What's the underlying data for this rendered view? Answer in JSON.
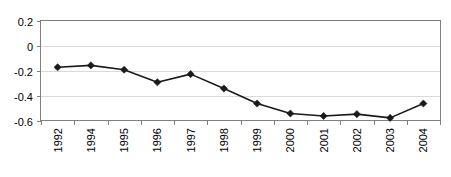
{
  "chart_data": {
    "type": "line",
    "title": "",
    "xlabel": "",
    "ylabel": "",
    "categories": [
      "1992",
      "1994",
      "1995",
      "1996",
      "1997",
      "1998",
      "1999",
      "2000",
      "2001",
      "2002",
      "2003",
      "2004"
    ],
    "values": [
      -0.17,
      -0.155,
      -0.19,
      -0.29,
      -0.225,
      -0.34,
      -0.46,
      -0.54,
      -0.56,
      -0.545,
      -0.575,
      -0.46
    ],
    "series": [
      {
        "name": "series-1",
        "values": [
          -0.17,
          -0.155,
          -0.19,
          -0.29,
          -0.225,
          -0.34,
          -0.46,
          -0.54,
          -0.56,
          -0.545,
          -0.575,
          -0.46
        ]
      }
    ],
    "ylim": [
      -0.6,
      0.2
    ],
    "yticks": [
      0.2,
      0,
      -0.2,
      -0.4,
      -0.6
    ],
    "ytick_labels": [
      "0.2",
      "0",
      "-0.2",
      "-0.4",
      "-0.6"
    ],
    "grid": true,
    "grid_axis": "y",
    "legend": false,
    "legend_position": "none",
    "marker": "diamond",
    "xtick_label_rotation": -90,
    "colors": {
      "line": "#1a1a1a",
      "marker": "#1a1a1a",
      "gridline": "#d9d9d9",
      "axis": "#808080",
      "background": "#ffffff",
      "text": "#000000"
    }
  }
}
